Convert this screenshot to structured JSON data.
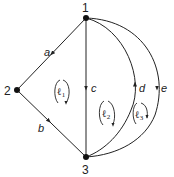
{
  "nodes": [
    {
      "id": "1",
      "label": "1"
    },
    {
      "id": "2",
      "label": "2"
    },
    {
      "id": "3",
      "label": "3"
    }
  ],
  "edges": [
    {
      "id": "a",
      "label": "a",
      "from": "1",
      "to": "2"
    },
    {
      "id": "b",
      "label": "b",
      "from": "2",
      "to": "3"
    },
    {
      "id": "c",
      "label": "c",
      "from": "1",
      "to": "3"
    },
    {
      "id": "d",
      "label": "d",
      "from": "3",
      "to": "1"
    },
    {
      "id": "e",
      "label": "e",
      "from": "1",
      "to": "3"
    }
  ],
  "loops": [
    {
      "id": "l1",
      "symbol": "ℓ",
      "sub": "1",
      "direction": "clockwise"
    },
    {
      "id": "l2",
      "symbol": "ℓ",
      "sub": "2",
      "direction": "clockwise"
    },
    {
      "id": "l3",
      "symbol": "ℓ",
      "sub": "3",
      "direction": "clockwise"
    }
  ],
  "colors": {
    "line": "#222222",
    "background": "#ffffff"
  }
}
